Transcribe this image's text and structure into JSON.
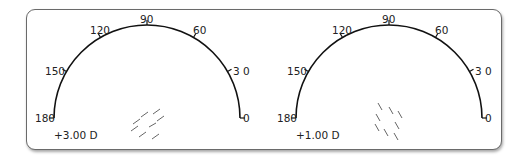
{
  "diagrams": [
    {
      "name": "left-dial",
      "power_label": "+3.00 D",
      "ticks": [
        {
          "label": "180",
          "angle": 180
        },
        {
          "label": "150",
          "angle": 150
        },
        {
          "label": "120",
          "angle": 120
        },
        {
          "label": "90",
          "angle": 90
        },
        {
          "label": "60",
          "angle": 60
        },
        {
          "label": "3 0",
          "angle": 30
        },
        {
          "label": "0",
          "angle": 0
        }
      ],
      "hatch_orientation": "oblique-30"
    },
    {
      "name": "right-dial",
      "power_label": "+1.00 D",
      "ticks": [
        {
          "label": "180",
          "angle": 180
        },
        {
          "label": "150",
          "angle": 150
        },
        {
          "label": "120",
          "angle": 120
        },
        {
          "label": "90",
          "angle": 90
        },
        {
          "label": "60",
          "angle": 60
        },
        {
          "label": "3 0",
          "angle": 30
        },
        {
          "label": "0",
          "angle": 0
        }
      ],
      "hatch_orientation": "oblique-120"
    }
  ],
  "colors": {
    "line": "#111111",
    "hatch": "#555555",
    "border": "#6a6a6a"
  }
}
